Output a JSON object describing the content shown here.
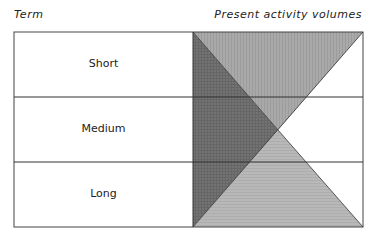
{
  "headers": {
    "term": "Term",
    "volumes": "Present activity volumes"
  },
  "rows": [
    {
      "label": "Short"
    },
    {
      "label": "Medium"
    },
    {
      "label": "Long"
    }
  ],
  "colors": {
    "dark_triangle": "#6e6e6e",
    "top_triangle": "#a8a8a8",
    "bottom_triangle": "#b6b6b6",
    "lines": "#333333"
  }
}
